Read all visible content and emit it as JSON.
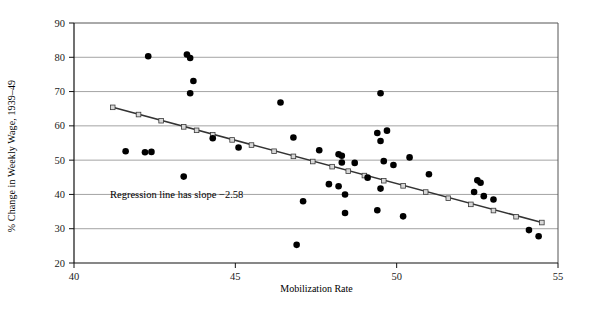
{
  "chart_data": {
    "type": "scatter",
    "title": "",
    "xlabel": "Mobilization Rate",
    "ylabel": "% Change in Weekly Wage, 1939–49",
    "xlim": [
      40,
      55
    ],
    "ylim": [
      20,
      90
    ],
    "xticks": [
      40,
      45,
      50,
      55
    ],
    "yticks": [
      20,
      30,
      40,
      50,
      60,
      70,
      80,
      90
    ],
    "grid": "horizontal",
    "legend": "none",
    "annotations": [
      {
        "text": "Regression line has slope −2.58",
        "x": 42.0,
        "y": 36.5
      }
    ],
    "series": [
      {
        "name": "States",
        "type": "scatter",
        "marker": "filled-circle",
        "color": "#000000",
        "points": [
          [
            42.3,
            80.3
          ],
          [
            43.5,
            80.8
          ],
          [
            43.6,
            79.8
          ],
          [
            43.7,
            73.1
          ],
          [
            43.6,
            69.5
          ],
          [
            46.4,
            66.8
          ],
          [
            49.5,
            69.5
          ],
          [
            44.3,
            56.4
          ],
          [
            41.6,
            52.6
          ],
          [
            42.2,
            52.3
          ],
          [
            42.4,
            52.4
          ],
          [
            45.1,
            53.7
          ],
          [
            43.4,
            45.2
          ],
          [
            46.8,
            56.6
          ],
          [
            47.6,
            52.9
          ],
          [
            48.2,
            51.7
          ],
          [
            48.3,
            51.3
          ],
          [
            48.3,
            49.3
          ],
          [
            48.7,
            49.2
          ],
          [
            49.6,
            49.7
          ],
          [
            49.9,
            48.6
          ],
          [
            49.7,
            58.6
          ],
          [
            49.4,
            57.9
          ],
          [
            49.5,
            55.6
          ],
          [
            50.4,
            50.8
          ],
          [
            51.0,
            45.9
          ],
          [
            47.9,
            43.0
          ],
          [
            48.2,
            42.4
          ],
          [
            49.1,
            44.9
          ],
          [
            48.4,
            40.0
          ],
          [
            49.5,
            41.7
          ],
          [
            47.1,
            38.0
          ],
          [
            48.4,
            34.6
          ],
          [
            49.4,
            35.4
          ],
          [
            50.2,
            33.6
          ],
          [
            46.9,
            25.3
          ],
          [
            52.5,
            44.1
          ],
          [
            52.6,
            43.4
          ],
          [
            52.4,
            40.7
          ],
          [
            52.7,
            39.5
          ],
          [
            53.0,
            38.5
          ],
          [
            54.1,
            29.6
          ],
          [
            54.4,
            27.8
          ]
        ]
      },
      {
        "name": "Regression line",
        "type": "line",
        "marker": "open-square",
        "color": "#333333",
        "slope": -2.58,
        "endpoints": [
          [
            41.2,
            65.4
          ],
          [
            54.5,
            31.8
          ]
        ],
        "markers": [
          [
            41.2,
            65.4
          ],
          [
            42.0,
            63.3
          ],
          [
            42.7,
            61.5
          ],
          [
            43.4,
            59.7
          ],
          [
            43.8,
            58.7
          ],
          [
            44.3,
            57.4
          ],
          [
            44.9,
            55.9
          ],
          [
            45.5,
            54.4
          ],
          [
            46.2,
            52.6
          ],
          [
            46.8,
            51.1
          ],
          [
            47.4,
            49.6
          ],
          [
            48.0,
            48.1
          ],
          [
            48.5,
            46.8
          ],
          [
            49.0,
            45.5
          ],
          [
            49.6,
            44.0
          ],
          [
            50.2,
            42.5
          ],
          [
            50.9,
            40.7
          ],
          [
            51.6,
            38.9
          ],
          [
            52.3,
            37.1
          ],
          [
            53.0,
            35.3
          ],
          [
            53.7,
            33.5
          ],
          [
            54.5,
            31.8
          ]
        ]
      }
    ]
  },
  "axis": {
    "x_tick_labels": [
      "40",
      "45",
      "50",
      "55"
    ],
    "y_tick_labels": [
      "20",
      "30",
      "40",
      "50",
      "60",
      "70",
      "80",
      "90"
    ]
  }
}
